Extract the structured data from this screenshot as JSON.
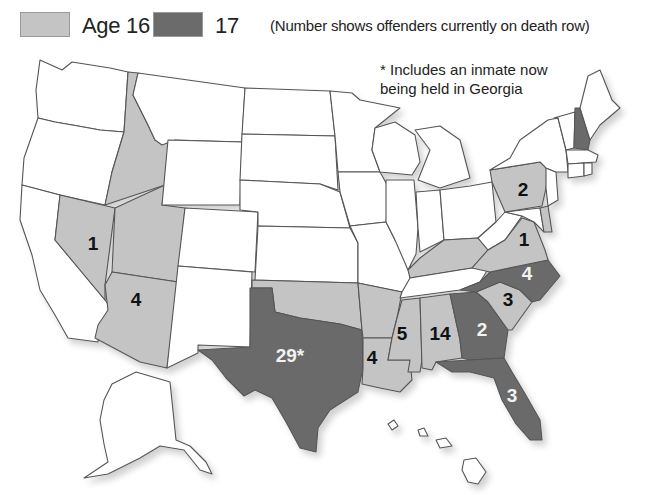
{
  "legend": {
    "items": [
      {
        "label": "Age 16",
        "color": "#c4c4c4"
      },
      {
        "label": "17",
        "color": "#6b6b6b"
      }
    ],
    "note": "(Number shows offenders currently on death row)"
  },
  "footnote": {
    "line1": "* Includes an inmate now",
    "line2": "being held in Georgia"
  },
  "colors": {
    "age16": "#c4c4c4",
    "age17": "#6b6b6b",
    "none": "#ffffff",
    "border": "#555555"
  },
  "states": {
    "idaho": {
      "category": "Age 16",
      "count": ""
    },
    "nevada": {
      "category": "Age 16",
      "count": "1"
    },
    "utah": {
      "category": "Age 16",
      "count": ""
    },
    "arizona": {
      "category": "Age 16",
      "count": "4"
    },
    "oklahoma": {
      "category": "Age 16",
      "count": ""
    },
    "arkansas": {
      "category": "Age 16",
      "count": ""
    },
    "louisiana": {
      "category": "Age 16",
      "count": "4"
    },
    "mississippi": {
      "category": "Age 16",
      "count": "5"
    },
    "alabama": {
      "category": "Age 16",
      "count": "14"
    },
    "kentucky": {
      "category": "Age 16",
      "count": ""
    },
    "virginia": {
      "category": "Age 16",
      "count": "1"
    },
    "south_carolina": {
      "category": "Age 16",
      "count": "3"
    },
    "pennsylvania": {
      "category": "Age 16",
      "count": "2"
    },
    "delaware": {
      "category": "Age 16",
      "count": ""
    },
    "texas": {
      "category": "17",
      "count": "29*"
    },
    "georgia": {
      "category": "17",
      "count": "2"
    },
    "florida": {
      "category": "17",
      "count": "3"
    },
    "north_carolina": {
      "category": "17",
      "count": "4"
    },
    "new_hampshire": {
      "category": "17",
      "count": ""
    }
  }
}
